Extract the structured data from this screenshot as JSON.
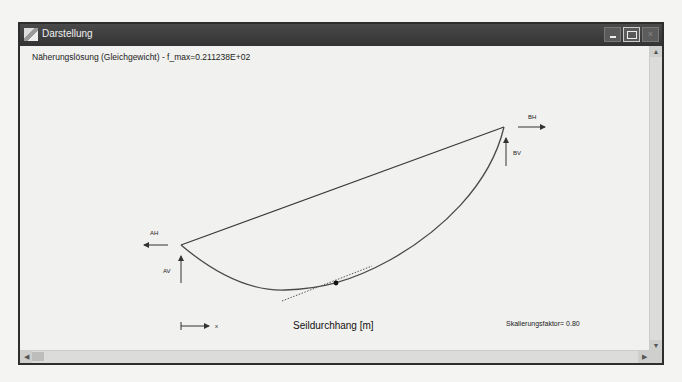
{
  "background": {
    "ghost_lines": [
      "ng (Kontinuitäts) und für die Aufgabe ist das Koor",
      "im Seilaufhängepunkt A",
      "zum Kapitel Seil",
      "Kleinen Schreiben die geführten Variablen"
    ]
  },
  "window": {
    "title": "Darstellung",
    "controls": {
      "minimize": "_",
      "maximize": "□",
      "close": "×"
    }
  },
  "plot": {
    "header": "Näherungslösung (Gleichgewicht) - f_max=0.211238E+02",
    "labels": {
      "AH": "AH",
      "AV": "AV",
      "BH": "BH",
      "BV": "BV",
      "x_axis": "x"
    },
    "axis_title": "Seildurchhang [m]",
    "scale_factor": "Skalierungsfaktor= 0.80",
    "colors": {
      "curve": "#4a4a4a",
      "chord": "#3a3a3a",
      "arrows": "#333333",
      "tangent": "#555555"
    }
  },
  "scrollbars": {
    "vertical": {
      "up": "▲",
      "down": "▼"
    },
    "horizontal": {
      "left": "◀",
      "right": "▶"
    }
  }
}
